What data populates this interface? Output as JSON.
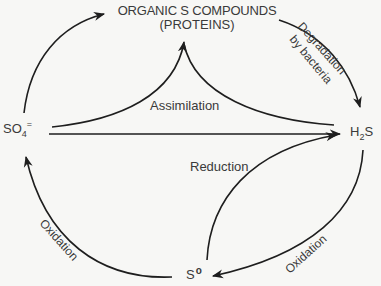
{
  "diagram": {
    "nodes": {
      "organic": {
        "line1": "ORGANIC S COMPOUNDS",
        "line2": "(PROTEINS)"
      },
      "sulfate": {
        "base": "SO",
        "sub": "4",
        "sup": "="
      },
      "hydrogen_sulfide": {
        "pre": "H",
        "sub": "2",
        "post": "S"
      },
      "elemental_sulfur": {
        "base": "S",
        "sup": "o"
      }
    },
    "edges": [
      {
        "id": "sulfate-to-organic",
        "from": "SO4=",
        "to": "Organic S compounds",
        "label": ""
      },
      {
        "id": "organic-to-h2s",
        "from": "Organic S compounds",
        "to": "H2S",
        "label": "Degradation by bacteria"
      },
      {
        "id": "assimilation",
        "from": "SO4= / H2S",
        "to": "Organic S compounds",
        "label": "Assimilation"
      },
      {
        "id": "sulfate-to-h2s",
        "from": "SO4=",
        "to": "H2S",
        "label": ""
      },
      {
        "id": "reduction",
        "from": "S°",
        "to": "H2S",
        "label": "Reduction"
      },
      {
        "id": "h2s-to-s0",
        "from": "H2S",
        "to": "S°",
        "label": "Oxidation"
      },
      {
        "id": "s0-to-sulfate",
        "from": "S°",
        "to": "SO4=",
        "label": "Oxidation"
      }
    ],
    "labels": {
      "degradation_line1": "Degradation",
      "degradation_line2": "by bacteria",
      "assimilation": "Assimilation",
      "reduction": "Reduction",
      "oxidation_left": "Oxidation",
      "oxidation_right": "Oxidation"
    },
    "colors": {
      "background": "#f7f7f5",
      "stroke": "#1e1e1e",
      "text": "#3a3a3a"
    }
  }
}
